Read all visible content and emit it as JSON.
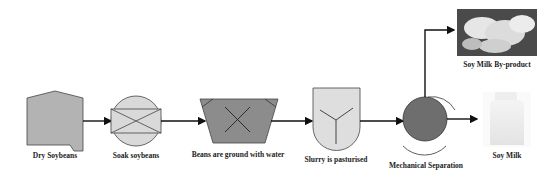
{
  "diagram": {
    "steps": [
      {
        "id": "dry-soybeans",
        "label": "Dry Soybeans"
      },
      {
        "id": "soak-soybeans",
        "label": "Soak soybeans"
      },
      {
        "id": "grind",
        "label": "Beans are ground with water"
      },
      {
        "id": "pasturise",
        "label": "Slurry is pasturised"
      },
      {
        "id": "separation",
        "label": "Mechanical Separation"
      }
    ],
    "outputs": [
      {
        "id": "by-product",
        "label": "Soy Milk By-product"
      },
      {
        "id": "soy-milk",
        "label": "Soy Milk"
      }
    ],
    "colors": {
      "silo": "#b3b3b3",
      "soak": "#d9d9d9",
      "grinder": "#8c8c8c",
      "pasteuriser": "#dedede",
      "separator": "#6e6e6e",
      "line": "#111111"
    }
  }
}
